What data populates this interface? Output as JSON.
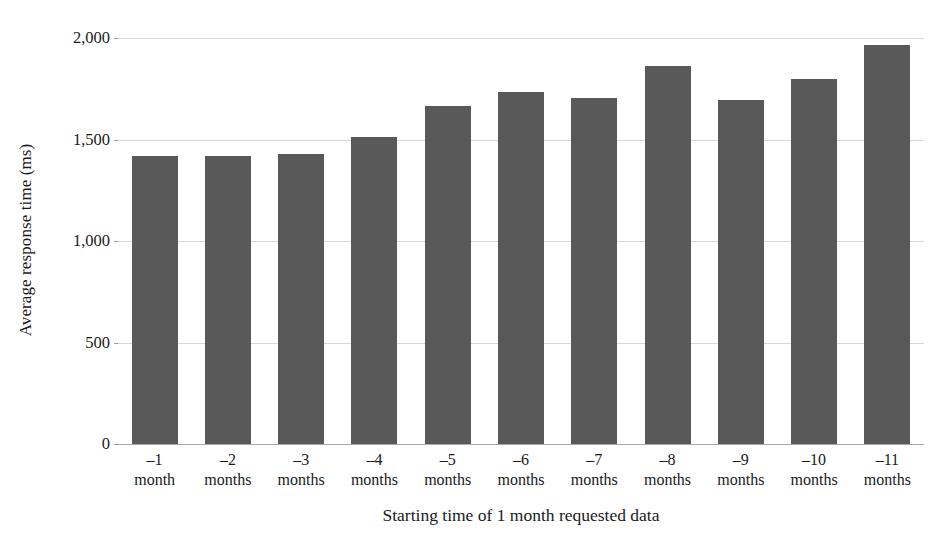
{
  "chart_data": {
    "type": "bar",
    "title": "",
    "xlabel": "Starting time of 1 month requested data",
    "ylabel": "Average response time (ms)",
    "categories": [
      "-1 month",
      "-2 months",
      "-3 months",
      "-4 months",
      "-5 months",
      "-6 months",
      "-7 months",
      "-8 months",
      "-9 months",
      "-10 months",
      "-11 months"
    ],
    "category_lines": [
      {
        "line1": "–1",
        "line2": "month"
      },
      {
        "line1": "–2",
        "line2": "months"
      },
      {
        "line1": "–3",
        "line2": "months"
      },
      {
        "line1": "–4",
        "line2": "months"
      },
      {
        "line1": "–5",
        "line2": "months"
      },
      {
        "line1": "–6",
        "line2": "months"
      },
      {
        "line1": "–7",
        "line2": "months"
      },
      {
        "line1": "–8",
        "line2": "months"
      },
      {
        "line1": "–9",
        "line2": "months"
      },
      {
        "line1": "–10",
        "line2": "months"
      },
      {
        "line1": "–11",
        "line2": "months"
      }
    ],
    "values": [
      1420,
      1420,
      1430,
      1510,
      1665,
      1735,
      1705,
      1860,
      1695,
      1800,
      1965
    ],
    "ylim": [
      0,
      2000
    ],
    "ytick_values": [
      0,
      500,
      1000,
      1500,
      2000
    ],
    "ytick_labels": [
      "0",
      "500",
      "1,000",
      "1,500",
      "2,000"
    ],
    "grid": true,
    "legend": "none",
    "series": [
      {
        "name": "Average response time",
        "values": [
          1420,
          1420,
          1430,
          1510,
          1665,
          1735,
          1705,
          1860,
          1695,
          1800,
          1965
        ]
      }
    ],
    "colors": {
      "bar": "#595959",
      "gridline": "#d8d8d8",
      "axis": "#a8a8a8",
      "text": "#1a1a1a",
      "background": "#ffffff"
    }
  }
}
